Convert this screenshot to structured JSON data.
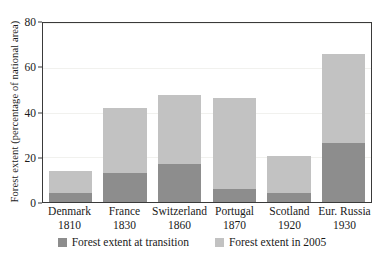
{
  "chart_data": {
    "type": "bar",
    "stacked": true,
    "title": "",
    "xlabel": "",
    "ylabel": "Forest extent (percentage of national area)",
    "ylim": [
      0,
      80
    ],
    "yticks": [
      0,
      20,
      40,
      60,
      80
    ],
    "grid": true,
    "legend_position": "bottom",
    "categories": [
      "Denmark 1810",
      "France 1830",
      "Switzerland 1860",
      "Portugal 1870",
      "Scotland 1920",
      "Eur. Russia 1930"
    ],
    "category_names": [
      "Denmark",
      "France",
      "Switzerland",
      "Portugal",
      "Scotland",
      "Eur. Russia"
    ],
    "category_years": [
      "1810",
      "1830",
      "1860",
      "1870",
      "1920",
      "1930"
    ],
    "series": [
      {
        "name": "Forest extent at transition",
        "color": "#8d8d8d",
        "values": [
          4,
          13,
          17,
          6,
          4,
          26.5
        ]
      },
      {
        "name": "Forest extent in 2005",
        "color": "#c2c2c2",
        "values": [
          14,
          42,
          48,
          46.5,
          20.5,
          66
        ]
      }
    ]
  },
  "axis": {
    "y_title": "Forest extent (percentage of national area)",
    "y_tick_labels": [
      "0",
      "20",
      "40",
      "60",
      "80"
    ]
  },
  "legend": {
    "items": [
      {
        "label": "Forest extent at transition",
        "swatch": "dark-gray-swatch"
      },
      {
        "label": "Forest extent in 2005",
        "swatch": "light-gray-swatch"
      }
    ]
  },
  "colors": {
    "transition": "#8d8d8d",
    "year2005": "#c2c2c2",
    "frame": "#3a3a3a",
    "grid": "#f1f1ee",
    "background": "#ffffff"
  }
}
